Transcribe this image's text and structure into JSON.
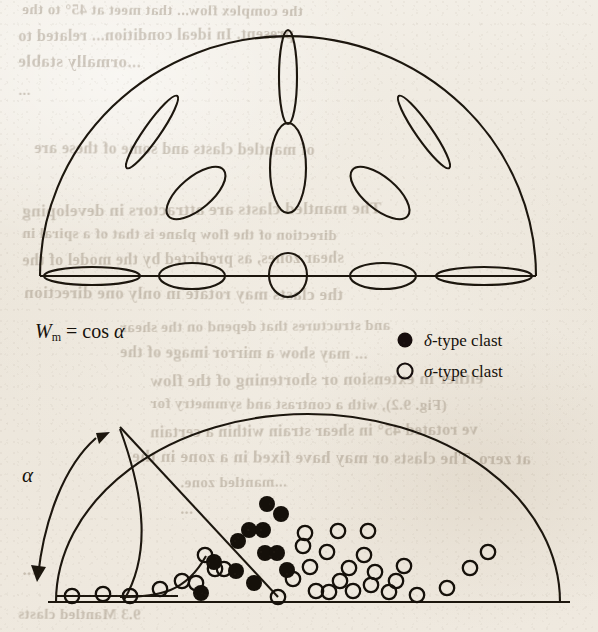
{
  "page": {
    "background_color": "#efeae1",
    "ink_color": "#16110b"
  },
  "figure": {
    "formula": {
      "symbol": "W",
      "subscript": "m",
      "equals": "=",
      "expression": "cos",
      "angle": "α"
    },
    "angle_label": "α",
    "legend": {
      "position": "top-right",
      "items": [
        {
          "marker": "filled-circle",
          "symbol": "δ",
          "label": "-type clast",
          "full": "δ-type clast"
        },
        {
          "marker": "open-circle",
          "symbol": "σ",
          "label": "-type clast",
          "full": "σ-type clast"
        }
      ]
    }
  },
  "chart_data": {
    "type": "scatter",
    "title": "",
    "xlabel": "",
    "ylabel": "",
    "grid": false,
    "legend_position": "top-right",
    "panels": [
      {
        "name": "upper-half-circle-clast-shapes",
        "description": "Semicircular diagram with ellipses showing clast shape and orientation variation",
        "dome": {
          "cx": 288,
          "cy": 276,
          "rx": 248,
          "ry": 240
        },
        "baseline_y": 276,
        "ellipses": [
          {
            "cx": 288,
            "cy": 77,
            "rx": 9,
            "ry": 47,
            "rot": 0,
            "group": "center-column"
          },
          {
            "cx": 288,
            "cy": 168,
            "rx": 18,
            "ry": 45,
            "rot": 0,
            "group": "center-column"
          },
          {
            "cx": 152,
            "cy": 132,
            "rx": 8,
            "ry": 44,
            "rot": 35,
            "group": "left-upper"
          },
          {
            "cx": 196,
            "cy": 193,
            "rx": 16,
            "ry": 36,
            "rot": 50,
            "group": "left-lower"
          },
          {
            "cx": 424,
            "cy": 132,
            "rx": 8,
            "ry": 44,
            "rot": -35,
            "group": "right-upper"
          },
          {
            "cx": 380,
            "cy": 193,
            "rx": 16,
            "ry": 36,
            "rot": -50,
            "group": "right-lower"
          },
          {
            "cx": 92,
            "cy": 276,
            "rx": 48,
            "ry": 9,
            "rot": 0,
            "group": "baseline"
          },
          {
            "cx": 192,
            "cy": 276,
            "rx": 33,
            "ry": 13,
            "rot": 0,
            "group": "baseline"
          },
          {
            "cx": 288,
            "cy": 275,
            "rx": 19,
            "ry": 22,
            "rot": 0,
            "group": "baseline"
          },
          {
            "cx": 383,
            "cy": 276,
            "rx": 33,
            "ry": 13,
            "rot": 0,
            "group": "baseline"
          },
          {
            "cx": 484,
            "cy": 276,
            "rx": 48,
            "ry": 9,
            "rot": 0,
            "group": "baseline"
          }
        ]
      },
      {
        "name": "lower-half-circle-clast-data",
        "description": "Semicircular plot of measured clast data with delta-type and sigma-type populations",
        "dome": {
          "cx": 308,
          "cy": 602,
          "rx": 252,
          "ry": 188
        },
        "baseline_y": 602,
        "apex": {
          "x": 120,
          "y": 427
        },
        "separatrix_line": {
          "x1": 120,
          "y1": 427,
          "x2": 278,
          "y2": 597
        },
        "inner_curve": {
          "x1": 120,
          "y1": 429,
          "x2": 148,
          "y2": 566,
          "x3": 124,
          "y3": 600
        },
        "baseline_rail": {
          "x1": 56,
          "y1": 596,
          "x2": 175,
          "y2": 596
        },
        "delta_points": [
          [
            267,
            504
          ],
          [
            281,
            514
          ],
          [
            249,
            530
          ],
          [
            263,
            530
          ],
          [
            238,
            541
          ],
          [
            265,
            553
          ],
          [
            277,
            553
          ],
          [
            236,
            571
          ],
          [
            287,
            570
          ],
          [
            214,
            562
          ],
          [
            254,
            583
          ],
          [
            201,
            593
          ]
        ],
        "sigma_points": [
          [
            305,
            533
          ],
          [
            338,
            531
          ],
          [
            368,
            531
          ],
          [
            303,
            546
          ],
          [
            327,
            552
          ],
          [
            364,
            555
          ],
          [
            310,
            567
          ],
          [
            349,
            568
          ],
          [
            375,
            572
          ],
          [
            404,
            566
          ],
          [
            293,
            579
          ],
          [
            340,
            581
          ],
          [
            371,
            585
          ],
          [
            396,
            581
          ],
          [
            316,
            591
          ],
          [
            329,
            592
          ],
          [
            353,
            591
          ],
          [
            389,
            592
          ],
          [
            417,
            595
          ],
          [
            470,
            568
          ],
          [
            488,
            552
          ],
          [
            447,
            588
          ],
          [
            205,
            555
          ],
          [
            215,
            569
          ],
          [
            224,
            569
          ],
          [
            182,
            581
          ],
          [
            196,
            583
          ],
          [
            160,
            589
          ],
          [
            72,
            596
          ],
          [
            103,
            594
          ],
          [
            130,
            596
          ],
          [
            278,
            597
          ]
        ],
        "series": [
          {
            "name": "δ-type clast",
            "marker": "filled-circle",
            "count": 12
          },
          {
            "name": "σ-type clast",
            "marker": "open-circle",
            "count": 32
          }
        ]
      }
    ]
  },
  "bleed_text": {
    "description": "faint mirrored show-through text from the reverse side of the page",
    "lines": [
      {
        "text": "the complex flow...  that meet at 45° to the",
        "x": 22,
        "y": 2
      },
      {
        "text": "present.  In ideal condition...  related to",
        "x": 18,
        "y": 26
      },
      {
        "text": "...ormally stable",
        "x": 18,
        "y": 52
      },
      {
        "text": "...",
        "x": 18,
        "y": 82
      },
      {
        "text": "of mantled clasts and some of these are",
        "x": 34,
        "y": 140
      },
      {
        "text": "The mantled clasts are attractors in developing",
        "x": 22,
        "y": 200
      },
      {
        "text": "direction of the flow plane is that of a spiral in",
        "x": 22,
        "y": 226
      },
      {
        "text": "shear zones, as predicted by the model of the",
        "x": 22,
        "y": 250
      },
      {
        "text": "the clasts may rotate in only one direction",
        "x": 24,
        "y": 284
      },
      {
        "text": "and structures that depend on the shear",
        "x": 120,
        "y": 318
      },
      {
        "text": "... may show a mirror image of the",
        "x": 120,
        "y": 344
      },
      {
        "text": "either in extension or shortening of the flow",
        "x": 150,
        "y": 370
      },
      {
        "text": "(Fig. 9.2), with a contrast and symmetry for",
        "x": 150,
        "y": 396
      },
      {
        "text": "ve rotated 45° in shear strain within a certain",
        "x": 150,
        "y": 422
      },
      {
        "text": "at zero.  The clasts or may have fixed in a zone in the",
        "x": 132,
        "y": 448
      },
      {
        "text": "...mantled zone.",
        "x": 180,
        "y": 474
      },
      {
        "text": "...",
        "x": 180,
        "y": 500
      },
      {
        "text": "...",
        "x": 22,
        "y": 560
      },
      {
        "text": "9.3 Mantled clasts",
        "x": 18,
        "y": 606
      }
    ]
  }
}
